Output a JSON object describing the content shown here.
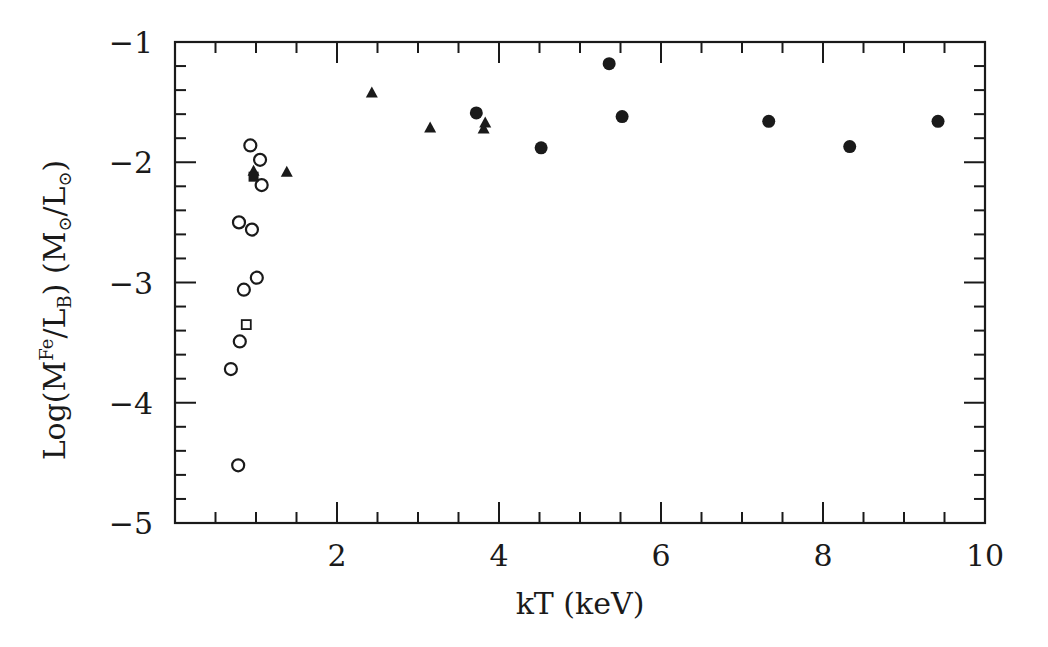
{
  "chart_data": {
    "type": "scatter",
    "title": "",
    "xlabel": "kT (keV)",
    "ylabel": {
      "prefix": "Log(M",
      "sup": "Fe",
      "mid": "/L",
      "sub": "B",
      "suffix": ")  (M",
      "sun1": "⊙",
      "slash": "/L",
      "sun2": "⊙",
      "end": ")"
    },
    "xlim": [
      0,
      10
    ],
    "ylim": [
      -5,
      -1
    ],
    "x_ticks": [
      2,
      4,
      6,
      8,
      10
    ],
    "x_tick_labels": [
      "2",
      "4",
      "6",
      "8",
      "10"
    ],
    "y_ticks": [
      -1,
      -2,
      -3,
      -4,
      -5
    ],
    "y_tick_labels": [
      "−1",
      "−2",
      "−3",
      "−4",
      "−5"
    ],
    "grid": false,
    "legend": null,
    "series": [
      {
        "name": "filled circles",
        "marker": "circle-filled",
        "points": [
          [
            3.72,
            -1.59
          ],
          [
            4.52,
            -1.88
          ],
          [
            5.36,
            -1.18
          ],
          [
            5.52,
            -1.62
          ],
          [
            7.33,
            -1.66
          ],
          [
            8.33,
            -1.87
          ],
          [
            9.42,
            -1.66
          ]
        ]
      },
      {
        "name": "filled triangles",
        "marker": "triangle-filled",
        "points": [
          [
            0.97,
            -2.07
          ],
          [
            1.38,
            -2.08
          ],
          [
            2.43,
            -1.42
          ],
          [
            3.15,
            -1.71
          ],
          [
            3.83,
            -1.67
          ],
          [
            3.81,
            -1.72
          ]
        ]
      },
      {
        "name": "open circles",
        "marker": "circle-open",
        "points": [
          [
            0.93,
            -1.86
          ],
          [
            1.05,
            -1.98
          ],
          [
            1.07,
            -2.19
          ],
          [
            0.79,
            -2.5
          ],
          [
            0.95,
            -2.56
          ],
          [
            1.01,
            -2.96
          ],
          [
            0.85,
            -3.06
          ],
          [
            0.8,
            -3.49
          ],
          [
            0.69,
            -3.72
          ],
          [
            0.78,
            -4.52
          ]
        ]
      },
      {
        "name": "filled squares",
        "marker": "square-filled",
        "points": [
          [
            0.97,
            -2.12
          ]
        ]
      },
      {
        "name": "open squares",
        "marker": "square-open",
        "points": [
          [
            0.88,
            -3.35
          ]
        ]
      }
    ]
  },
  "colors": {
    "ink": "#1a1a1a",
    "background": "#ffffff"
  }
}
